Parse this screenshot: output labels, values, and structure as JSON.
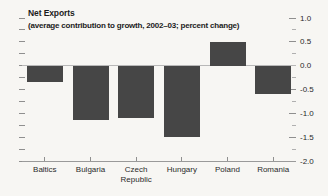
{
  "chart_data": {
    "type": "bar",
    "title": "Net Exports",
    "subtitle": "(average contribution to growth, 2002–03; percent change)",
    "categories": [
      "Baltics",
      "Bulgaria",
      "Czech Republic",
      "Hungary",
      "Poland",
      "Romania"
    ],
    "values": [
      -0.35,
      -1.15,
      -1.1,
      -1.5,
      0.5,
      -0.6
    ],
    "ylim": [
      -2.0,
      1.0
    ],
    "y_major_ticks": [
      1.0,
      0.5,
      0.0,
      -0.5,
      -1.0,
      -1.5,
      -2.0
    ],
    "y_major_tick_labels": [
      "1.0",
      "0.5",
      "0.0",
      "-0.5",
      "-1.0",
      "-1.5",
      "-2.0"
    ],
    "y_minor_tick_step": 0.25,
    "y_axis_side": "right",
    "grid": false,
    "colors": {
      "bar": "#464646",
      "background": "#f7f6f3",
      "zero_line": "#b8b8b8",
      "axis_line": "#9a9a9a",
      "tick": "#8f8f8f",
      "text": "#1c1c1c"
    }
  }
}
